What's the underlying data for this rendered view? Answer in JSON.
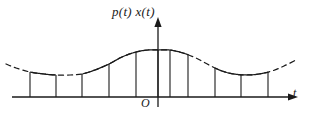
{
  "figure": {
    "name": "sampled-signal-impulse-train",
    "background": "#ffffff",
    "stroke_color": "#1a1a1a",
    "labels": {
      "y_axis": "p(t) x(t)",
      "t_axis": "t",
      "origin": "O"
    },
    "icons": {
      "y_axis_arrow": "arrow-up-icon",
      "t_axis_arrow": "arrow-right-icon"
    }
  },
  "chart_data": {
    "type": "line",
    "title": "p(t) x(t)",
    "xlabel": "t",
    "ylabel": "p(t) x(t)",
    "grid": false,
    "legend": null,
    "origin_label": "O",
    "axes": {
      "baseline_y_px": 97,
      "x_axis_start_px": 12,
      "x_axis_end_px": 288,
      "y_axis_x_px": 158,
      "y_axis_top_px": 27
    },
    "envelope": {
      "description": "raised-cosine modulation envelope, drawn dashed where it is not coincident with sample tops",
      "period_px": 238,
      "peak_y_px": 50,
      "trough_y_px": 75,
      "dash_pattern": "5 4",
      "x_range_px": [
        6,
        296
      ],
      "points": [
        {
          "x": 6,
          "y": 64
        },
        {
          "x": 16,
          "y": 68
        },
        {
          "x": 30,
          "y": 72
        },
        {
          "x": 44,
          "y": 74
        },
        {
          "x": 56,
          "y": 75
        },
        {
          "x": 70,
          "y": 75
        },
        {
          "x": 82,
          "y": 74
        },
        {
          "x": 95,
          "y": 70
        },
        {
          "x": 109,
          "y": 64
        },
        {
          "x": 122,
          "y": 57
        },
        {
          "x": 136,
          "y": 52
        },
        {
          "x": 148,
          "y": 50
        },
        {
          "x": 158,
          "y": 50
        },
        {
          "x": 170,
          "y": 50
        },
        {
          "x": 183,
          "y": 53
        },
        {
          "x": 196,
          "y": 58
        },
        {
          "x": 209,
          "y": 65
        },
        {
          "x": 222,
          "y": 71
        },
        {
          "x": 234,
          "y": 74
        },
        {
          "x": 247,
          "y": 75
        },
        {
          "x": 259,
          "y": 74
        },
        {
          "x": 272,
          "y": 71
        },
        {
          "x": 284,
          "y": 66
        },
        {
          "x": 296,
          "y": 60
        }
      ]
    },
    "samples": {
      "description": "vertical impulse lines from baseline up to the envelope value",
      "count": 11,
      "x_px": [
        30,
        56,
        82,
        109,
        136,
        158,
        170,
        188,
        215,
        241,
        268
      ],
      "top_y_px": [
        72,
        75,
        74,
        64,
        52,
        50,
        50,
        54,
        68,
        75,
        72
      ],
      "height_px": [
        25,
        22,
        23,
        33,
        45,
        47,
        47,
        43,
        29,
        22,
        25
      ]
    },
    "solid_segments": [
      {
        "from_x": 30,
        "to_x": 56
      },
      {
        "from_x": 82,
        "to_x": 136
      },
      {
        "from_x": 136,
        "to_x": 188
      },
      {
        "from_x": 215,
        "to_x": 268
      }
    ],
    "dashed_segments": [
      {
        "from_x": 6,
        "to_x": 30
      },
      {
        "from_x": 56,
        "to_x": 82
      },
      {
        "from_x": 188,
        "to_x": 215
      },
      {
        "from_x": 268,
        "to_x": 296
      }
    ]
  }
}
